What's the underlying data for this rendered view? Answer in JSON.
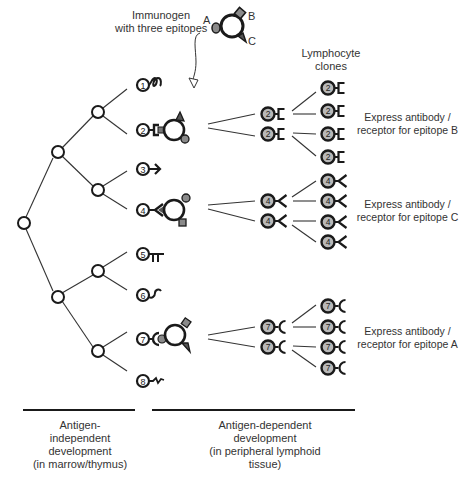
{
  "immunogen": {
    "label_line1": "Immunogen",
    "label_line2": "with three epitopes",
    "epitopes": [
      "A",
      "B",
      "C"
    ]
  },
  "clones_header": {
    "line1": "Lymphocyte",
    "line2": "clones"
  },
  "precursor_numbers": [
    "1",
    "2",
    "3",
    "4",
    "5",
    "6",
    "7",
    "8"
  ],
  "expanded_clones": [
    {
      "number": "2",
      "receptor_shape": "square-bracket",
      "label_line1": "Express antibody /",
      "label_line2": "receptor for epitope B"
    },
    {
      "number": "4",
      "receptor_shape": "v-fork",
      "label_line1": "Express antibody /",
      "label_line2": "receptor for epitope C"
    },
    {
      "number": "7",
      "receptor_shape": "c-cup",
      "label_line1": "Express antibody /",
      "label_line2": "receptor for epitope A"
    }
  ],
  "phases": [
    {
      "line1": "Antigen-",
      "line2": "independent",
      "line3": "development",
      "line4": "(in marrow/thymus)"
    },
    {
      "line1": "Antigen-dependent",
      "line2": "development",
      "line3": "(in peripheral lymphoid",
      "line4": "tissue)"
    }
  ],
  "colors": {
    "stroke": "#1a1a1a",
    "clone_fill": "#b8b8b8",
    "epitope_fill": "#8a8a8a",
    "text": "#333333"
  }
}
